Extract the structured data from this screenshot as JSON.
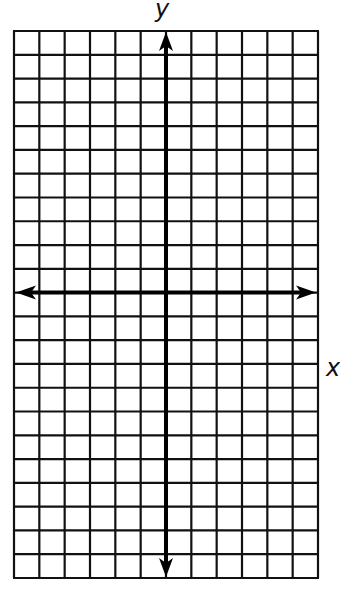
{
  "diagram": {
    "type": "coordinate-grid",
    "labels": {
      "x_axis": "x",
      "y_axis": "y"
    },
    "grid": {
      "columns": 12,
      "rows": 23,
      "left": 14,
      "right": 318,
      "top": 31,
      "bottom": 578,
      "line_color": "#111111",
      "line_width": 2.2
    },
    "axes": {
      "y_axis_column_index": 6,
      "x_axis_row_index": 11,
      "color": "#000000",
      "line_width": 4,
      "arrows": [
        "up",
        "down",
        "left",
        "right"
      ]
    },
    "colors": {
      "background": "#ffffff",
      "ink": "#111111"
    }
  }
}
